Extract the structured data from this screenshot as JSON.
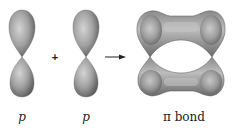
{
  "diagram": {
    "orbitals": [
      {
        "id": "p1",
        "label": "p",
        "center_x": 22,
        "node_y": 57
      },
      {
        "id": "p2",
        "label": "p",
        "center_x": 86,
        "node_y": 57
      }
    ],
    "operator": "+",
    "arrow": {
      "from_x": 105,
      "to_x": 126,
      "y": 57
    },
    "result": {
      "label": "π bond",
      "center_x": 181,
      "node_y": 57
    },
    "colors": {
      "lobe_light": "#c8c8c8",
      "lobe_mid": "#9a9a9a",
      "lobe_dark": "#5e5e5e",
      "text": "#222222"
    }
  }
}
